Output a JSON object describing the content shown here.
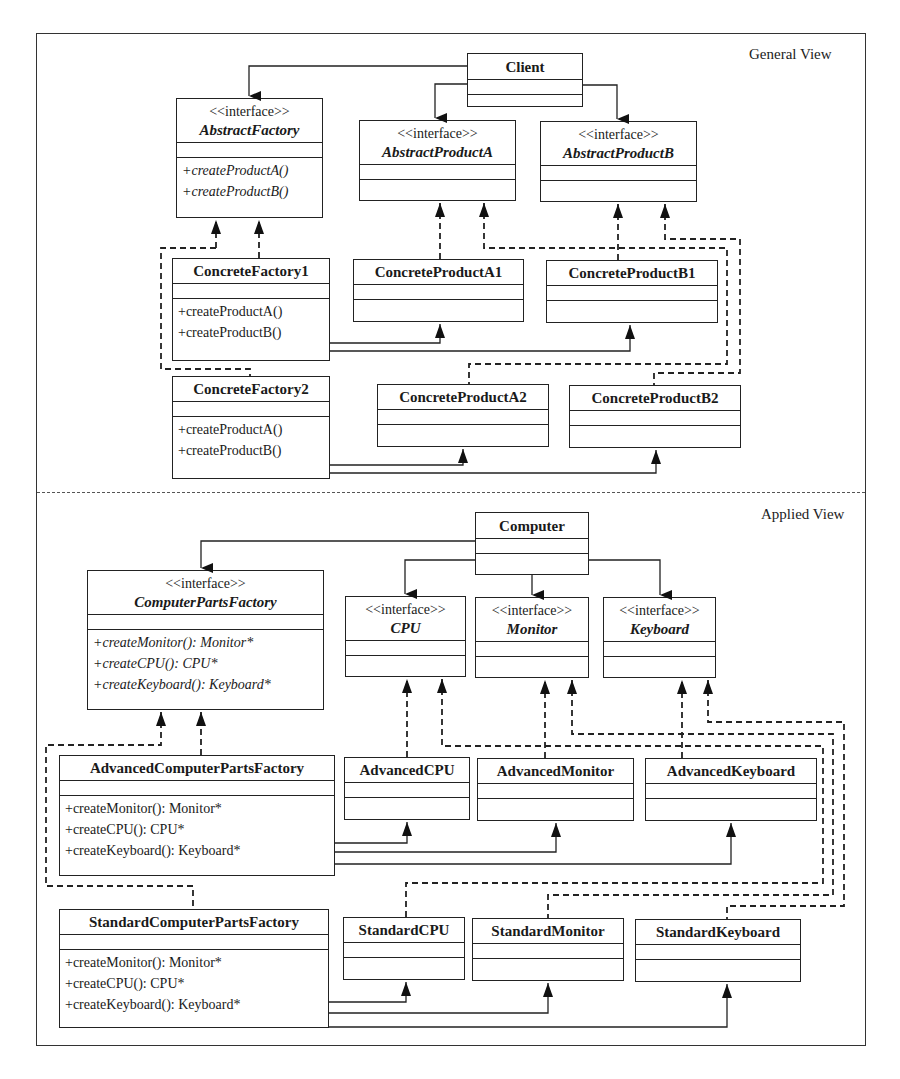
{
  "diagram": {
    "general_view": {
      "label": "General View",
      "classes": {
        "client": {
          "name": "Client",
          "ops": []
        },
        "abstract_factory": {
          "stereotype": "<<interface>>",
          "name": "AbstractFactory",
          "ops": [
            "+createProductA()",
            "+createProductB()"
          ]
        },
        "abstract_product_a": {
          "stereotype": "<<interface>>",
          "name": "AbstractProductA",
          "ops": []
        },
        "abstract_product_b": {
          "stereotype": "<<interface>>",
          "name": "AbstractProductB",
          "ops": []
        },
        "concrete_factory_1": {
          "name": "ConcreteFactory1",
          "ops": [
            "+createProductA()",
            "+createProductB()"
          ]
        },
        "concrete_factory_2": {
          "name": "ConcreteFactory2",
          "ops": [
            "+createProductA()",
            "+createProductB()"
          ]
        },
        "concrete_product_a1": {
          "name": "ConcreteProductA1",
          "ops": []
        },
        "concrete_product_b1": {
          "name": "ConcreteProductB1",
          "ops": []
        },
        "concrete_product_a2": {
          "name": "ConcreteProductA2",
          "ops": []
        },
        "concrete_product_b2": {
          "name": "ConcreteProductB2",
          "ops": []
        }
      }
    },
    "applied_view": {
      "label": "Applied View",
      "classes": {
        "computer": {
          "name": "Computer",
          "ops": []
        },
        "computer_parts_factory": {
          "stereotype": "<<interface>>",
          "name": "ComputerPartsFactory",
          "ops": [
            "+createMonitor(): Monitor*",
            "+createCPU(): CPU*",
            "+createKeyboard(): Keyboard*"
          ]
        },
        "cpu": {
          "stereotype": "<<interface>>",
          "name": "CPU",
          "ops": []
        },
        "monitor": {
          "stereotype": "<<interface>>",
          "name": "Monitor",
          "ops": []
        },
        "keyboard": {
          "stereotype": "<<interface>>",
          "name": "Keyboard",
          "ops": []
        },
        "advanced_factory": {
          "name": "AdvancedComputerPartsFactory",
          "ops": [
            "+createMonitor(): Monitor*",
            "+createCPU(): CPU*",
            "+createKeyboard(): Keyboard*"
          ]
        },
        "standard_factory": {
          "name": "StandardComputerPartsFactory",
          "ops": [
            "+createMonitor(): Monitor*",
            "+createCPU(): CPU*",
            "+createKeyboard(): Keyboard*"
          ]
        },
        "advanced_cpu": {
          "name": "AdvancedCPU",
          "ops": []
        },
        "advanced_monitor": {
          "name": "AdvancedMonitor",
          "ops": []
        },
        "advanced_keyboard": {
          "name": "AdvancedKeyboard",
          "ops": []
        },
        "standard_cpu": {
          "name": "StandardCPU",
          "ops": []
        },
        "standard_monitor": {
          "name": "StandardMonitor",
          "ops": []
        },
        "standard_keyboard": {
          "name": "StandardKeyboard",
          "ops": []
        }
      }
    },
    "colors": {
      "line": "#222222",
      "background": "#ffffff"
    }
  }
}
